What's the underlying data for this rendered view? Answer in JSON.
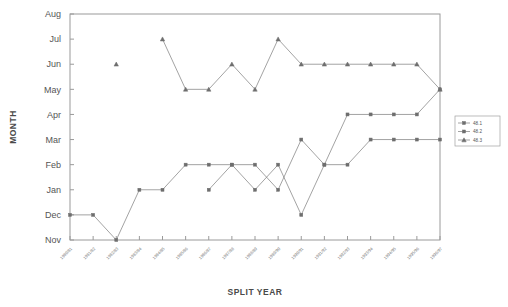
{
  "chart_data": {
    "type": "line",
    "title": "",
    "xlabel": "SPLIT YEAR",
    "ylabel": "MONTH",
    "grid": false,
    "legend_position": "right",
    "ytick_labels": [
      "Aug",
      "Jul",
      "Jun",
      "May",
      "Apr",
      "Mar",
      "Feb",
      "Jan",
      "Dec",
      "Nov"
    ],
    "ylim": [
      "Nov",
      "Aug"
    ],
    "categories": [
      "1980/81",
      "1981/82",
      "1982/83",
      "1983/84",
      "1984/85",
      "1985/86",
      "1986/87",
      "1987/88",
      "1988/89",
      "1989/90",
      "1990/91",
      "1991/92",
      "1992/93",
      "1993/94",
      "1994/95",
      "1995/96",
      "1996/97"
    ],
    "series": [
      {
        "name": "48.1",
        "marker": "square",
        "values": [
          null,
          null,
          null,
          null,
          null,
          null,
          "Jan",
          "Feb",
          "Feb",
          "Jan",
          "Mar",
          "Feb",
          "Apr",
          "Apr",
          "Apr",
          "Apr",
          "May"
        ]
      },
      {
        "name": "48.2",
        "marker": "square",
        "values": [
          "Dec",
          "Dec",
          "Nov",
          "Jan",
          "Jan",
          "Feb",
          "Feb",
          "Feb",
          "Jan",
          "Feb",
          "Dec",
          "Feb",
          "Feb",
          "Mar",
          "Mar",
          "Mar",
          "Mar"
        ]
      },
      {
        "name": "48.3",
        "marker": "triangle",
        "values": [
          null,
          null,
          "Jun",
          null,
          "Jul",
          "May",
          "May",
          "Jun",
          "May",
          "Jul",
          "Jun",
          "Jun",
          "Jun",
          "Jun",
          "Jun",
          "Jun",
          "May"
        ]
      }
    ]
  },
  "legend": {
    "entries": [
      {
        "label": "48.1"
      },
      {
        "label": "48.2"
      },
      {
        "label": "48.3"
      }
    ]
  }
}
